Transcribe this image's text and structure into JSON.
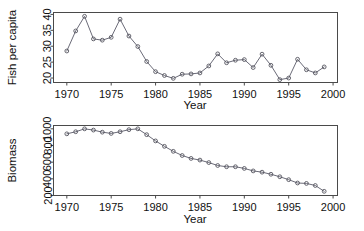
{
  "figure": {
    "background_color": "#ffffff",
    "line_color": "#6b6b78",
    "axis_color": "#4a4a4a",
    "point_color": "#55555f"
  },
  "chart_data": [
    {
      "type": "line",
      "panel": "top",
      "title": "",
      "xlabel": "Year",
      "ylabel": "Fish per capita",
      "xlim": [
        1968.5,
        2000.5
      ],
      "ylim": [
        18.6,
        40.6
      ],
      "xticks": [
        1970,
        1975,
        1980,
        1985,
        1990,
        1995,
        2000
      ],
      "xticklabels": [
        "1970",
        "1975",
        "1980",
        "1985",
        "1990",
        "1995",
        "2000"
      ],
      "yticks": [
        20,
        25,
        30,
        35,
        40
      ],
      "yticklabels": [
        "20",
        "25",
        "30",
        "35",
        "40"
      ],
      "grid": false,
      "legend": false,
      "marker": "open-circle",
      "x": [
        1970,
        1971,
        1972,
        1973,
        1974,
        1975,
        1976,
        1977,
        1978,
        1979,
        1980,
        1981,
        1982,
        1983,
        1984,
        1985,
        1986,
        1987,
        1988,
        1989,
        1990,
        1991,
        1992,
        1993,
        1994,
        1995,
        1996,
        1997,
        1998,
        1999
      ],
      "y": [
        28.5,
        34.8,
        39.4,
        32.3,
        31.9,
        32.8,
        38.5,
        33.2,
        29.9,
        25.2,
        22.0,
        20.8,
        19.9,
        21.2,
        21.3,
        21.6,
        23.8,
        27.6,
        24.8,
        25.6,
        25.8,
        23.3,
        27.5,
        24.0,
        19.5,
        20.0,
        25.9,
        22.6,
        21.6,
        23.5
      ]
    },
    {
      "type": "line",
      "panel": "bottom",
      "title": "",
      "xlabel": "Year",
      "ylabel": "Biomass",
      "xlim": [
        1968.5,
        2000.5
      ],
      "ylim": [
        200,
        1040
      ],
      "xticks": [
        1970,
        1975,
        1980,
        1985,
        1990,
        1995,
        2000
      ],
      "xticklabels": [
        "1970",
        "1975",
        "1980",
        "1985",
        "1990",
        "1995",
        "2000"
      ],
      "yticks": [
        200,
        400,
        600,
        800,
        1000
      ],
      "yticklabels": [
        "200",
        "400",
        "600",
        "800",
        "1000"
      ],
      "grid": false,
      "legend": false,
      "marker": "open-circle",
      "x": [
        1970,
        1971,
        1972,
        1973,
        1974,
        1975,
        1976,
        1977,
        1978,
        1979,
        1980,
        1981,
        1982,
        1983,
        1984,
        1985,
        1986,
        1987,
        1988,
        1989,
        1990,
        1991,
        1992,
        1993,
        1994,
        1995,
        1996,
        1997,
        1998,
        1999
      ],
      "y": [
        940,
        965,
        1000,
        985,
        960,
        945,
        965,
        990,
        1000,
        930,
        855,
        790,
        730,
        680,
        645,
        625,
        595,
        560,
        545,
        545,
        525,
        495,
        480,
        455,
        425,
        390,
        350,
        345,
        320,
        250
      ]
    }
  ]
}
